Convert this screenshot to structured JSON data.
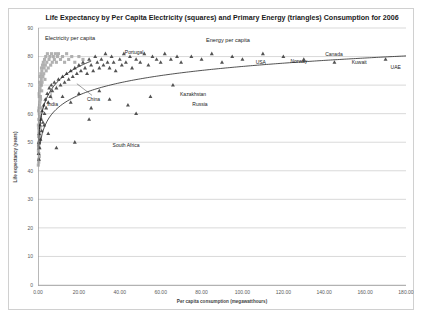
{
  "chart_data": {
    "type": "scatter",
    "title": "Life Expectancy by Per Capita Electricity (squares) and Primary Energy (triangles) Consumption for 2006",
    "xlabel": "Per capita consumption (megawatthours)",
    "ylabel": "Life expectancy (years)",
    "xlim": [
      0,
      180
    ],
    "ylim": [
      0,
      90
    ],
    "xticks": [
      "0.00",
      "20.00",
      "40.00",
      "60.00",
      "80.00",
      "100.00",
      "120.00",
      "140.00",
      "160.00",
      "180.00"
    ],
    "xtick_values": [
      0,
      20,
      40,
      60,
      80,
      100,
      120,
      140,
      160,
      180
    ],
    "yticks": [
      "0",
      "10",
      "20",
      "30",
      "40",
      "50",
      "60",
      "70",
      "80",
      "90"
    ],
    "ytick_values": [
      0,
      10,
      20,
      30,
      40,
      50,
      60,
      70,
      80,
      90
    ],
    "grid": "horizontal",
    "legend_position": "inline-annotations",
    "series": [
      {
        "name": "Electricity per capita",
        "marker": "square",
        "color": "#a6a6a6",
        "label_x": 22,
        "label_y": 86,
        "points": [
          [
            0.2,
            47
          ],
          [
            0.25,
            49
          ],
          [
            0.3,
            44
          ],
          [
            0.3,
            52
          ],
          [
            0.35,
            55
          ],
          [
            0.4,
            46
          ],
          [
            0.4,
            58
          ],
          [
            0.45,
            50
          ],
          [
            0.5,
            62
          ],
          [
            0.5,
            54
          ],
          [
            0.55,
            48
          ],
          [
            0.6,
            60
          ],
          [
            0.6,
            66
          ],
          [
            0.7,
            57
          ],
          [
            0.7,
            51
          ],
          [
            0.75,
            63
          ],
          [
            0.8,
            68
          ],
          [
            0.85,
            59
          ],
          [
            0.9,
            71
          ],
          [
            0.95,
            64
          ],
          [
            1.0,
            55
          ],
          [
            1.0,
            69
          ],
          [
            1.1,
            73
          ],
          [
            1.2,
            66
          ],
          [
            1.3,
            70
          ],
          [
            1.4,
            74
          ],
          [
            1.5,
            62
          ],
          [
            1.6,
            72
          ],
          [
            1.7,
            76
          ],
          [
            1.8,
            68
          ],
          [
            1.9,
            75
          ],
          [
            2.0,
            71
          ],
          [
            2.2,
            77
          ],
          [
            2.4,
            73
          ],
          [
            2.6,
            78
          ],
          [
            2.8,
            74
          ],
          [
            3.0,
            76
          ],
          [
            3.2,
            79
          ],
          [
            3.4,
            72
          ],
          [
            3.6,
            77
          ],
          [
            3.8,
            80
          ],
          [
            4.0,
            75
          ],
          [
            4.3,
            78
          ],
          [
            4.6,
            81
          ],
          [
            5.0,
            76
          ],
          [
            5.4,
            79
          ],
          [
            5.8,
            80
          ],
          [
            6.2,
            77
          ],
          [
            6.6,
            81
          ],
          [
            7.0,
            78
          ],
          [
            7.5,
            80
          ],
          [
            8.0,
            79
          ],
          [
            8.5,
            81
          ],
          [
            9.0,
            78
          ],
          [
            9.5,
            80
          ],
          [
            10.0,
            81
          ],
          [
            11.0,
            79
          ],
          [
            12.0,
            80
          ],
          [
            13.0,
            78
          ],
          [
            14.0,
            81
          ],
          [
            15.0,
            79
          ],
          [
            16.5,
            80
          ],
          [
            18.0,
            78
          ],
          [
            20.0,
            80
          ],
          [
            22.0,
            79
          ],
          [
            0.15,
            42
          ],
          [
            0.2,
            56
          ],
          [
            0.3,
            61
          ],
          [
            0.35,
            43
          ],
          [
            0.45,
            53
          ],
          [
            0.55,
            67
          ],
          [
            0.65,
            45
          ],
          [
            0.8,
            52
          ],
          [
            1.05,
            59
          ],
          [
            1.25,
            65
          ],
          [
            1.45,
            58
          ],
          [
            1.65,
            70
          ]
        ]
      },
      {
        "name": "Energy per capita",
        "marker": "triangle",
        "color": "#404040",
        "label_x": 78,
        "label_y": 84,
        "points": [
          [
            0.3,
            46
          ],
          [
            0.4,
            50
          ],
          [
            0.5,
            44
          ],
          [
            0.6,
            53
          ],
          [
            0.8,
            48
          ],
          [
            1.0,
            56
          ],
          [
            1.2,
            51
          ],
          [
            1.5,
            58
          ],
          [
            1.8,
            54
          ],
          [
            2.0,
            61
          ],
          [
            2.4,
            57
          ],
          [
            2.8,
            63
          ],
          [
            3.2,
            60
          ],
          [
            3.6,
            65
          ],
          [
            4.0,
            62
          ],
          [
            4.5,
            67
          ],
          [
            5.0,
            64
          ],
          [
            5.5,
            69
          ],
          [
            6.0,
            66
          ],
          [
            6.5,
            70
          ],
          [
            7.0,
            68
          ],
          [
            8.0,
            71
          ],
          [
            9.0,
            69
          ],
          [
            10.0,
            72
          ],
          [
            11.0,
            70
          ],
          [
            12.0,
            73
          ],
          [
            13.0,
            71
          ],
          [
            14.0,
            74
          ],
          [
            15.0,
            72
          ],
          [
            16.0,
            75
          ],
          [
            17.0,
            73
          ],
          [
            18.0,
            76
          ],
          [
            19.0,
            74
          ],
          [
            20.0,
            77
          ],
          [
            21.0,
            75
          ],
          [
            22.0,
            78
          ],
          [
            23.0,
            76
          ],
          [
            24.0,
            74
          ],
          [
            25.0,
            79
          ],
          [
            26.0,
            77
          ],
          [
            27.0,
            75
          ],
          [
            28.0,
            80
          ],
          [
            29.0,
            78
          ],
          [
            30.0,
            76
          ],
          [
            31.0,
            79
          ],
          [
            32.0,
            77
          ],
          [
            33.0,
            81
          ],
          [
            34.0,
            78
          ],
          [
            35.0,
            76
          ],
          [
            36.0,
            80
          ],
          [
            37.0,
            78
          ],
          [
            38.0,
            75
          ],
          [
            40.0,
            79
          ],
          [
            41.0,
            77
          ],
          [
            42.0,
            81
          ],
          [
            43.0,
            78
          ],
          [
            45.0,
            80
          ],
          [
            46.0,
            76
          ],
          [
            48.0,
            79
          ],
          [
            50.0,
            78
          ],
          [
            52.0,
            81
          ],
          [
            54.0,
            77
          ],
          [
            56.0,
            80
          ],
          [
            58.0,
            79
          ],
          [
            60.0,
            78
          ],
          [
            62.0,
            81
          ],
          [
            65.0,
            79
          ],
          [
            68.0,
            80
          ],
          [
            70.0,
            78
          ],
          [
            75.0,
            80
          ],
          [
            80.0,
            79
          ],
          [
            85.0,
            81
          ],
          [
            90.0,
            78
          ],
          [
            95.0,
            80
          ],
          [
            100.0,
            79
          ],
          [
            110.0,
            81
          ],
          [
            120.0,
            80
          ],
          [
            130.0,
            79
          ],
          [
            145.0,
            78
          ],
          [
            170.0,
            79
          ],
          [
            12.0,
            66
          ],
          [
            16.0,
            64
          ],
          [
            20.0,
            67
          ],
          [
            26.0,
            62
          ],
          [
            30.0,
            68
          ],
          [
            35.0,
            65
          ],
          [
            44.0,
            63
          ],
          [
            55.0,
            66
          ],
          [
            66.0,
            70
          ],
          [
            9.0,
            48
          ],
          [
            18.0,
            50
          ],
          [
            5.0,
            53
          ],
          [
            3.0,
            56
          ],
          [
            25.0,
            58
          ],
          [
            48.0,
            60
          ]
        ]
      }
    ],
    "trendlines": [
      {
        "name": "electricity-trend",
        "style": "log-curve-steep"
      },
      {
        "name": "energy-trend",
        "style": "log-curve-shallow"
      }
    ],
    "annotations": [
      {
        "label": "India",
        "x": 3.0,
        "y": 63.5,
        "marker_x": 6.0,
        "marker_y": 68.5,
        "leader": true
      },
      {
        "label": "China",
        "x": 22.5,
        "y": 65.0,
        "marker_x": 19.0,
        "marker_y": 70.5,
        "leader": true
      },
      {
        "label": "Portugal",
        "x": 41.0,
        "y": 81.5,
        "marker_x": 41.0,
        "marker_y": 81.5,
        "leader": false
      },
      {
        "label": "Kazakhstan",
        "x": 68.0,
        "y": 67.0,
        "marker_x": 66.0,
        "marker_y": 68.5,
        "leader": false
      },
      {
        "label": "Russia",
        "x": 74.0,
        "y": 63.5,
        "marker_x": 72.0,
        "marker_y": 65.0,
        "leader": false
      },
      {
        "label": "South Africa",
        "x": 35.0,
        "y": 49.0,
        "marker_x": 33.0,
        "marker_y": 51.5,
        "leader": false
      },
      {
        "label": "USA",
        "x": 105.0,
        "y": 78.0,
        "marker_x": 103.0,
        "marker_y": 79.5,
        "leader": false
      },
      {
        "label": "Norway",
        "x": 122.0,
        "y": 78.5,
        "marker_x": 122.0,
        "marker_y": 80.5,
        "leader": false
      },
      {
        "label": "Canada",
        "x": 139.0,
        "y": 81.0,
        "marker_x": 137.0,
        "marker_y": 81.5,
        "leader": false
      },
      {
        "label": "Kuwait",
        "x": 152.0,
        "y": 78.0,
        "marker_x": 149.0,
        "marker_y": 79.5,
        "leader": false
      },
      {
        "label": "UAE",
        "x": 171.0,
        "y": 76.5,
        "marker_x": 171.0,
        "marker_y": 78.5,
        "leader": false
      }
    ]
  },
  "colors": {
    "square_marker": "#a6a6a6",
    "triangle_marker": "#404040",
    "gridline": "#bfbfbf",
    "frame_border": "#d0d0d0",
    "trendline": "#262626",
    "text": "#1a1a1a"
  }
}
